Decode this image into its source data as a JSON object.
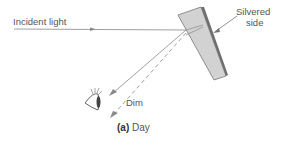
{
  "labels": {
    "incident": "Incident light",
    "silvered_line1": "Silvered",
    "silvered_line2": "side",
    "dim": "Dim"
  },
  "caption": {
    "tag": "(a)",
    "text": "Day"
  },
  "colors": {
    "glass_fill": "#d2d2d2",
    "silver": "#6e6e6e",
    "ray": "#888888"
  }
}
